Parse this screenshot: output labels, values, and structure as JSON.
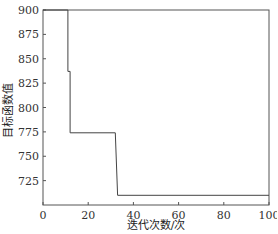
{
  "chart_data": {
    "type": "line",
    "title": "",
    "xlabel": "迭代次数/次",
    "ylabel": "目标函数值",
    "xlim": [
      0,
      100
    ],
    "ylim": [
      700,
      900
    ],
    "xticks": [
      0,
      20,
      40,
      60,
      80,
      100
    ],
    "yticks": [
      725,
      750,
      775,
      800,
      825,
      850,
      875,
      900
    ],
    "grid": false,
    "legend": null,
    "series": [
      {
        "name": "目标函数值",
        "step": true,
        "x": [
          0,
          11,
          11,
          12,
          12,
          32,
          33,
          100
        ],
        "y": [
          900,
          900,
          837,
          837,
          774,
          774,
          710,
          710
        ]
      }
    ]
  }
}
